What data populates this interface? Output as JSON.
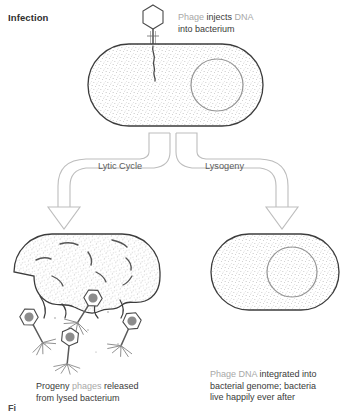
{
  "figure": {
    "title_partial": "Fi",
    "section_label": "Infection"
  },
  "captions": {
    "infection": {
      "line1_gray": "Phage injects ",
      "line1_word_gray2": "DNA",
      "line1_dark": "injects",
      "full_line1": "Phage injects DNA",
      "line2": "into bacterium",
      "parts": [
        {
          "text": "Phage ",
          "tone": "gray"
        },
        {
          "text": "injects ",
          "tone": "dark"
        },
        {
          "text": "DNA",
          "tone": "gray"
        }
      ]
    },
    "lytic": {
      "line1_parts": [
        {
          "text": "Progeny ",
          "tone": "dark"
        },
        {
          "text": "phages ",
          "tone": "gray"
        },
        {
          "text": " released",
          "tone": "dark"
        }
      ],
      "line1": "Progeny phages  released",
      "line2": "from lysed bacterium"
    },
    "lysogeny": {
      "line1_parts": [
        {
          "text": "Phage DNA ",
          "tone": "gray"
        },
        {
          "text": "integrated into",
          "tone": "dark"
        }
      ],
      "line1": "Phage DNA integrated into",
      "line2": "bacterial genome; bacteria",
      "line3": "live happily ever after"
    }
  },
  "pathways": {
    "left_label": "Lytic Cycle",
    "right_label": "Lysogeny"
  },
  "icons": {
    "phage_top": "bacteriophage-icon",
    "bacterium_infected": "bacterium-icon",
    "bacterium_lysed": "lysed-bacterium-icon",
    "bacterium_lysogenic": "lysogenic-bacterium-icon",
    "genome_circle": "genome-circle-icon",
    "arrow_left": "branch-arrow-left-icon",
    "arrow_right": "branch-arrow-right-icon",
    "dna_strand": "dna-strand-icon",
    "progeny_phages": "progeny-phage-icon"
  },
  "colors": {
    "outline": "#3c3c3c",
    "stipple": "#6a6a6a",
    "genome_ring": "#8e8e8e",
    "arrow_stroke": "#b4b4b4",
    "text_dark": "#3a3a3a",
    "text_gray": "#a8a8a8",
    "phage_head_fill": "#8c8c8c",
    "background": "#ffffff"
  },
  "counts": {
    "progeny_phages_shown": 4,
    "pathways": 2
  }
}
